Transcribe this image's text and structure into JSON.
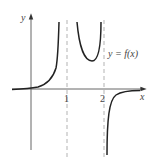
{
  "diagram": {
    "type": "function-graph",
    "axes": {
      "x_label": "x",
      "y_label": "y",
      "x_ticks": [
        "1",
        "2"
      ]
    },
    "curve_label": "y = f(x)",
    "vertical_asymptotes": [
      1,
      2
    ],
    "colors": {
      "curve": "#222222",
      "axis": "#555555",
      "asymptote": "#aaaaaa",
      "text": "#444444"
    }
  }
}
